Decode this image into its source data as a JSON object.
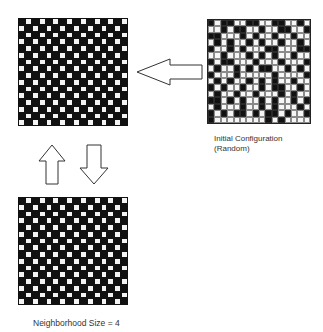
{
  "diagram": {
    "initial": {
      "caption_line1": "Initial Configuration",
      "caption_line2": "(Random)",
      "rows": 16,
      "cols": 16,
      "pattern": [
        "BWBBWWBBWWBBWWBW",
        "WWBWBBWWBWWBBWWB",
        "BBWWWBWBWWBWWBWW",
        "WBWBWWBWBWWBWWBW",
        "BWWBWBWWWBBWWWBB",
        "WWBWWWBWBWBWWBWW",
        "BWBBWWWBWWWBWWWB",
        "WBWWBWBWBBWWBWBW",
        "BWWWBWWWWWBWWWWB",
        "WBWBWWBWBWBWWBWW",
        "BWBWWBWWBWBBWWBW",
        "WBWWBWWBWWWBWBWW",
        "BBWBWBWWBWBWWBWB",
        "WBWWWBWWBWBWWWBW",
        "BWBWBBWBWBBWBWWB",
        "BWWWWWWWWBWBWWWW"
      ]
    },
    "state_a": {
      "rows": 16,
      "cols": 16,
      "pattern_type": "checkerboard",
      "phase": 0
    },
    "state_b": {
      "rows": 16,
      "cols": 16,
      "pattern_type": "checkerboard",
      "phase": 0
    },
    "neighborhood_label": "Neighborhood Size = 4",
    "arrows": {
      "initial_to_state_a": "left-arrow",
      "state_b_to_state_a": "up-arrow",
      "state_a_to_state_b": "down-arrow"
    },
    "colors": {
      "cell_on": "#111111",
      "cell_off": "#f4f4f4",
      "outline": "#333333"
    }
  }
}
